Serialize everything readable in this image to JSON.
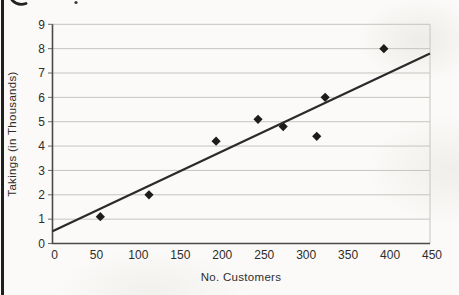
{
  "chart_data": {
    "type": "scatter",
    "title": "",
    "xlabel": "No. Customers",
    "ylabel": "Takings (in Thousands)",
    "xlim": [
      0,
      450
    ],
    "ylim": [
      0,
      9
    ],
    "x_ticks": [
      0,
      50,
      100,
      150,
      200,
      250,
      300,
      350,
      400,
      450
    ],
    "y_ticks": [
      0,
      1,
      2,
      3,
      4,
      5,
      6,
      7,
      8,
      9
    ],
    "grid": "horizontal-only",
    "legend_position": "none",
    "series": [
      {
        "name": "takings-scatter",
        "type": "scatter",
        "marker": "diamond",
        "points": [
          [
            57,
            1.1
          ],
          [
            115,
            2.0
          ],
          [
            195,
            4.2
          ],
          [
            245,
            5.1
          ],
          [
            275,
            4.8
          ],
          [
            315,
            4.4
          ],
          [
            325,
            6.0
          ],
          [
            395,
            8.0
          ]
        ]
      },
      {
        "name": "line-of-best-fit",
        "type": "line",
        "points": [
          [
            0,
            0.5
          ],
          [
            450,
            7.8
          ]
        ]
      }
    ],
    "colors": {
      "marker": "#1c1c1c",
      "trend_line": "#2a2a2a",
      "axis": "#4a4a48",
      "gridline": "#c6c4c0",
      "tick": "#6b6b69",
      "text": "#2e2d2b",
      "page_background": "#fbfaf8",
      "page_border": "#1f1f1f"
    }
  },
  "scan_artifacts": {
    "top_left_mark": "cut-off handwritten stroke",
    "top_dot": "small ink dot"
  }
}
